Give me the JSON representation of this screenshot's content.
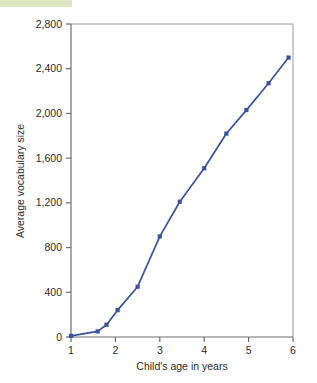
{
  "chart_data": {
    "type": "line",
    "title": "",
    "xlabel": "Child's age in years",
    "ylabel": "Average vocabulary size",
    "xlim": [
      1,
      6
    ],
    "ylim": [
      0,
      2800
    ],
    "grid": false,
    "legend": null,
    "line_color": "#3a52a0",
    "marker": "square",
    "xticks": [
      "1",
      "2",
      "3",
      "4",
      "5",
      "6"
    ],
    "xtick_values": [
      1,
      2,
      3,
      4,
      5,
      6
    ],
    "yticks": [
      "0",
      "400",
      "800",
      "1,200",
      "1,600",
      "2,000",
      "2,400",
      "2,800"
    ],
    "ytick_values": [
      0,
      400,
      800,
      1200,
      1600,
      2000,
      2400,
      2800
    ],
    "x": [
      1.0,
      1.6,
      1.8,
      2.05,
      2.5,
      3.0,
      3.45,
      4.0,
      4.5,
      4.95,
      5.45,
      5.9
    ],
    "values": [
      10,
      50,
      110,
      240,
      450,
      900,
      1210,
      1510,
      1820,
      2030,
      2270,
      2500
    ],
    "points": [
      {
        "x": 1.0,
        "y": 10
      },
      {
        "x": 1.6,
        "y": 50
      },
      {
        "x": 1.8,
        "y": 110
      },
      {
        "x": 2.05,
        "y": 240
      },
      {
        "x": 2.5,
        "y": 450
      },
      {
        "x": 3.0,
        "y": 900
      },
      {
        "x": 3.45,
        "y": 1210
      },
      {
        "x": 4.0,
        "y": 1510
      },
      {
        "x": 4.5,
        "y": 1820
      },
      {
        "x": 4.95,
        "y": 2030
      },
      {
        "x": 5.45,
        "y": 2270
      },
      {
        "x": 5.9,
        "y": 2500
      }
    ]
  }
}
